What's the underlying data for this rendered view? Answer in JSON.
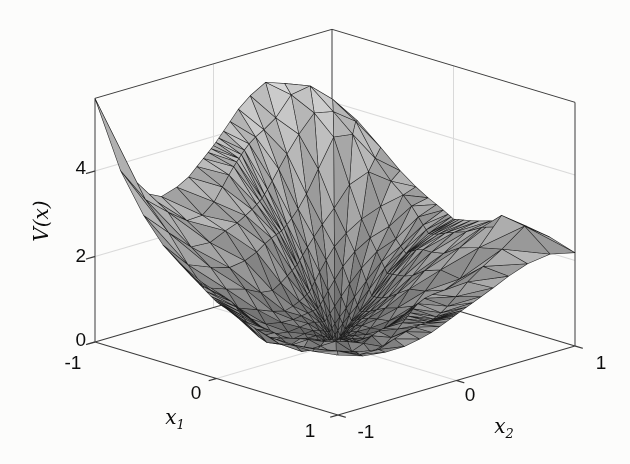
{
  "axes": {
    "zlabel": "V(x)",
    "xlabel": {
      "main": "x",
      "sub": "1"
    },
    "ylabel": {
      "main": "x",
      "sub": "2"
    },
    "z_ticks": [
      "0",
      "2",
      "4"
    ],
    "x_ticks": [
      "-1",
      "0",
      "1"
    ],
    "y_ticks": [
      "-1",
      "0",
      "1"
    ]
  },
  "chart_data": {
    "type": "surface",
    "title": "",
    "xlabel": "x_1",
    "ylabel": "x_2",
    "zlabel": "V(x)",
    "xlim": [
      -1,
      1
    ],
    "ylim": [
      -1,
      1
    ],
    "zlim": [
      0,
      5.7
    ],
    "x_tick_values": [
      -1,
      0,
      1
    ],
    "y_tick_values": [
      -1,
      0,
      1
    ],
    "z_tick_values": [
      0,
      2,
      4
    ],
    "x1_knots": [
      -1,
      -0.75,
      -0.5,
      -0.25,
      0,
      0.25,
      0.5,
      0.75,
      1
    ],
    "x2_knots": [
      -1,
      -0.75,
      -0.5,
      -0.25,
      0,
      0.25,
      0.5,
      0.75,
      1
    ],
    "z_grid": [
      [
        5.7,
        3.6,
        2.9,
        3.1,
        3.8,
        4.6,
        5.0,
        4.4,
        3.9
      ],
      [
        3.9,
        3.0,
        2.55,
        2.8,
        3.4,
        4.2,
        5.2,
        4.5,
        3.7
      ],
      [
        2.9,
        2.3,
        1.9,
        2.05,
        2.7,
        3.6,
        4.5,
        3.9,
        3.0
      ],
      [
        2.3,
        1.55,
        1.1,
        0.85,
        1.25,
        2.2,
        2.9,
        2.7,
        2.5
      ],
      [
        1.8,
        1.05,
        0.6,
        0.28,
        0.0,
        0.75,
        1.5,
        1.95,
        2.1
      ],
      [
        1.5,
        0.9,
        0.5,
        0.27,
        0.45,
        0.95,
        1.55,
        2.15,
        2.3
      ],
      [
        1.3,
        0.85,
        0.6,
        0.55,
        0.85,
        1.35,
        1.9,
        2.7,
        2.5
      ],
      [
        1.3,
        1.0,
        0.9,
        0.95,
        1.25,
        1.65,
        2.2,
        3.0,
        2.4
      ],
      [
        1.4,
        1.2,
        1.1,
        1.25,
        1.55,
        1.85,
        2.15,
        2.35,
        2.2
      ]
    ],
    "grid_lines": {
      "z": [
        2,
        4
      ],
      "x1": [
        0
      ],
      "x2": [
        0
      ]
    },
    "mesh_coords": [
      -1,
      -0.79,
      -0.6,
      -0.44,
      -0.31,
      -0.21,
      -0.14,
      -0.085,
      -0.045,
      -0.02,
      0,
      0.02,
      0.045,
      0.085,
      0.14,
      0.21,
      0.31,
      0.44,
      0.6,
      0.79,
      1
    ],
    "view": {
      "a0": 335,
      "ax": 121.5,
      "ay": 118.5,
      "b0": 344,
      "bx": 36.5,
      "by": -34.5,
      "h": 42.75,
      "depth": [
        0.452,
        -0.454,
        0.766
      ]
    },
    "render": {
      "edge_color": "#1b1b1b",
      "edge_width": 0.55,
      "box_color": "#3a3a3a",
      "grid_color": "#d9d9d9",
      "tick_color": "#3a3a3a",
      "noise_amp": 0.14,
      "gray_min": 0.29,
      "gray_max": 0.93
    }
  }
}
